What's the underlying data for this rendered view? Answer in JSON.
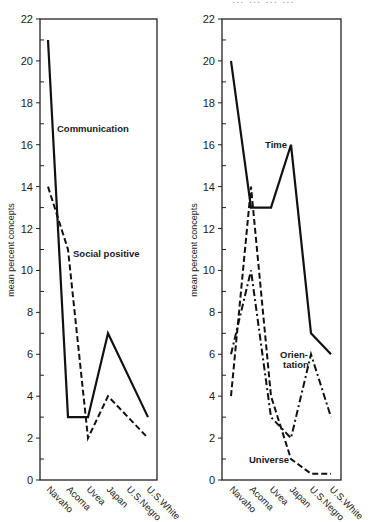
{
  "header_fragment": "...  ...  ...  ...",
  "chart_data": [
    {
      "type": "line",
      "title": "",
      "xlabel": "",
      "ylabel": "mean percent concepts",
      "ylim": [
        0,
        22
      ],
      "yticks": [
        0,
        2,
        4,
        6,
        8,
        10,
        12,
        14,
        16,
        18,
        20,
        22
      ],
      "grid": false,
      "categories": [
        "Navaho",
        "Acoma",
        "Uvea",
        "Japan",
        "U.S.Negro",
        "U.S.White"
      ],
      "series": [
        {
          "name": "Communication",
          "style": "solid",
          "values": [
            21,
            3,
            3,
            7,
            null,
            3
          ]
        },
        {
          "name": "Social positive",
          "style": "dashed",
          "values": [
            14,
            11,
            2,
            4,
            null,
            2
          ]
        }
      ],
      "annotations": [
        {
          "text": "Communication",
          "series": "Communication"
        },
        {
          "text": "Social positive",
          "series": "Social positive"
        }
      ]
    },
    {
      "type": "line",
      "title": "",
      "xlabel": "",
      "ylabel": "mean percent concepts",
      "ylim": [
        0,
        22
      ],
      "yticks": [
        0,
        2,
        4,
        6,
        8,
        10,
        12,
        14,
        16,
        18,
        20,
        22
      ],
      "grid": false,
      "categories": [
        "Navaho",
        "Acoma",
        "Uvea",
        "Japan",
        "U.S.Negro",
        "U.S.White"
      ],
      "series": [
        {
          "name": "Time",
          "style": "solid",
          "values": [
            20,
            13,
            13,
            16,
            7,
            6
          ]
        },
        {
          "name": "Universe",
          "style": "dashed",
          "values": [
            4,
            14,
            4,
            1,
            0.3,
            0.3
          ]
        },
        {
          "name": "Orientation",
          "style": "dashdot",
          "values": [
            6,
            10,
            3,
            2,
            6,
            3
          ]
        }
      ],
      "annotations": [
        {
          "text": "Time",
          "series": "Time"
        },
        {
          "text": "Orien-",
          "series": "Orientation"
        },
        {
          "text": "tation",
          "series": "Orientation"
        },
        {
          "text": "Universe",
          "series": "Universe"
        }
      ]
    }
  ]
}
